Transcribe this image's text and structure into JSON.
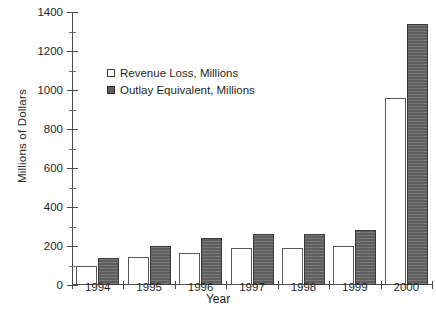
{
  "chart_data": {
    "type": "bar",
    "title": "",
    "xlabel": "Year",
    "ylabel": "Millions of Dollars",
    "categories": [
      "1994",
      "1995",
      "1996",
      "1997",
      "1998",
      "1999",
      "2000"
    ],
    "series": [
      {
        "name": "Revenue Loss, Millions",
        "color": "#ffffff",
        "values": [
          100,
          145,
          165,
          190,
          190,
          200,
          960
        ]
      },
      {
        "name": "Outlay Equivalent, Millions",
        "color": "#696969",
        "values": [
          140,
          200,
          240,
          262,
          262,
          280,
          1340
        ]
      }
    ],
    "ylim": [
      0,
      1400
    ],
    "y_ticks": [
      0,
      200,
      400,
      600,
      800,
      1000,
      1200,
      1400
    ],
    "y_minor_ticks": [
      100,
      300,
      500,
      700,
      900,
      1100,
      1300
    ],
    "grid": false,
    "legend_position": "upper-left-inside"
  },
  "legend": {
    "entries": [
      {
        "label": "Revenue Loss, Millions",
        "swatch": "open-square"
      },
      {
        "label": "Outlay Equivalent, Millions",
        "swatch": "filled-square"
      }
    ]
  },
  "axes": {
    "y_title": "Millions of Dollars",
    "x_title": "Year"
  }
}
